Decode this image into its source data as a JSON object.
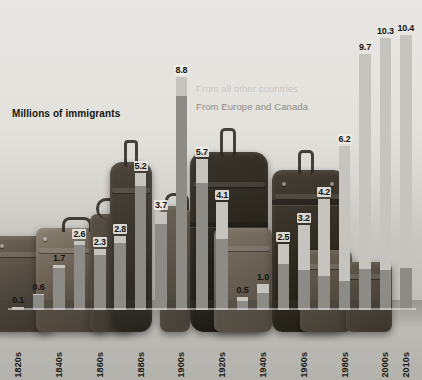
{
  "chart_data": {
    "type": "bar",
    "title": "",
    "ylabel": "Millions of immigrants",
    "xlabel": "",
    "ylim": [
      0,
      11.2
    ],
    "grid": false,
    "stacked": true,
    "legend_position": "inside-upper-center",
    "categories": [
      "1820s",
      "1830s",
      "1840s",
      "1850s",
      "1860s",
      "1870s",
      "1880s",
      "1890s",
      "1900s",
      "1910s",
      "1920s",
      "1930s",
      "1940s",
      "1950s",
      "1960s",
      "1970s",
      "1980s",
      "1990s",
      "2000s",
      "2010s"
    ],
    "tick_labels": [
      "1820s",
      "",
      "1840s",
      "",
      "1860s",
      "",
      "1880s",
      "",
      "1900s",
      "",
      "1920s",
      "",
      "1940s",
      "",
      "1960s",
      "",
      "1980s",
      "",
      "2000s",
      "2010s"
    ],
    "values": [
      0.1,
      0.6,
      1.7,
      2.6,
      2.3,
      2.8,
      5.2,
      3.7,
      8.8,
      5.7,
      4.1,
      0.5,
      1.0,
      2.5,
      3.2,
      4.2,
      6.2,
      9.7,
      10.3,
      10.4
    ],
    "data_labels": [
      "0.1",
      "0.6",
      "1.7",
      "2.6",
      "2.3",
      "2.8",
      "5.2",
      "3.7",
      "8.8",
      "5.7",
      "4.1",
      "0.5",
      "1.0",
      "2.5",
      "3.2",
      "4.2",
      "6.2",
      "9.7",
      "10.3",
      "10.4"
    ],
    "series": [
      {
        "name": "From Europe and Canada",
        "color": "#8d8b86",
        "values": [
          0.09,
          0.55,
          1.6,
          2.45,
          2.1,
          2.55,
          4.7,
          3.25,
          8.1,
          4.8,
          2.7,
          0.33,
          0.65,
          1.75,
          1.5,
          1.3,
          1.1,
          1.55,
          1.5,
          1.6
        ]
      },
      {
        "name": "From all other countries",
        "color": "#c6c4bf",
        "values": [
          0.01,
          0.05,
          0.1,
          0.15,
          0.2,
          0.25,
          0.5,
          0.45,
          0.7,
          0.9,
          1.4,
          0.17,
          0.35,
          0.75,
          1.7,
          2.9,
          5.1,
          8.15,
          8.8,
          8.8
        ]
      }
    ],
    "legend": [
      {
        "label": "From all other countries",
        "color": "#c9c7c2"
      },
      {
        "label": "From Europe and Canada",
        "color": "#8d8b86"
      }
    ]
  },
  "colors": {
    "series_other": "#c6c4bf",
    "series_europe": "#8d8b86",
    "label_text": "#16150f",
    "baseline": "#ffffff"
  }
}
